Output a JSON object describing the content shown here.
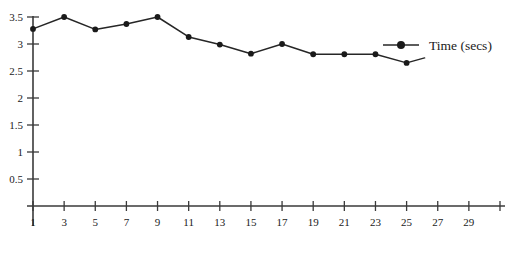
{
  "chart_data": {
    "type": "line",
    "title": "",
    "xlabel": "",
    "ylabel": "",
    "x": [
      1,
      3,
      5,
      7,
      9,
      11,
      13,
      15,
      17,
      19,
      21,
      23,
      25
    ],
    "values": [
      3.28,
      3.5,
      3.27,
      3.37,
      3.5,
      3.13,
      2.99,
      2.82,
      3.0,
      2.81,
      2.81,
      2.81,
      2.65
    ],
    "series": [
      {
        "name": "Time (secs)",
        "x": [
          1,
          3,
          5,
          7,
          9,
          11,
          13,
          15,
          17,
          19,
          21,
          23,
          25
        ],
        "values": [
          3.28,
          3.5,
          3.27,
          3.37,
          3.5,
          3.13,
          2.99,
          2.82,
          3.0,
          2.81,
          2.81,
          2.81,
          2.65
        ]
      }
    ],
    "xlim": [
      0,
      31
    ],
    "ylim": [
      0,
      3.5
    ],
    "x_ticks": [
      1,
      3,
      5,
      7,
      9,
      11,
      13,
      15,
      17,
      19,
      21,
      23,
      25,
      27,
      29,
      31
    ],
    "x_tick_labels": [
      "1",
      "3",
      "5",
      "7",
      "9",
      "11",
      "13",
      "15",
      "17",
      "19",
      "21",
      "23",
      "25",
      "27",
      "29",
      ""
    ],
    "y_ticks": [
      0.5,
      1,
      1.5,
      2,
      2.5,
      3,
      3.5
    ],
    "y_tick_labels": [
      "0.5",
      "1",
      "1.5",
      "2",
      "2.5",
      "3",
      "3.5"
    ],
    "grid": false,
    "legend": {
      "position": "top-right",
      "entries": [
        {
          "label": "Time (secs)",
          "marker": "filled-circle",
          "color": "#1a1a1a"
        }
      ]
    },
    "colors": {
      "line": "#262626",
      "marker": "#1a1a1a",
      "axis": "#3a3a3a",
      "text": "#1a1a1a",
      "background": "#ffffff"
    }
  }
}
